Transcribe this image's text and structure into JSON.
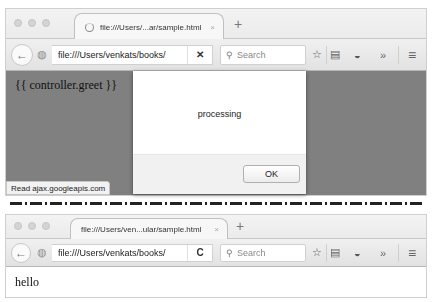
{
  "top_window": {
    "tab": {
      "title": "file:///Users/...ar/sample.html",
      "close": "×",
      "loading": true
    },
    "new_tab": "+",
    "nav": {
      "back": "←",
      "url": "file:///Users/venkats/books/",
      "url_action": "✕",
      "search_placeholder": "Search"
    },
    "toolbar_icons": {
      "bookmark": "☆",
      "reading_list": "▤",
      "pocket": "◒",
      "overflow": "»",
      "menu": "≡"
    },
    "content": {
      "template_text": "{{ controller.greet }}",
      "status_text": "Read ajax.googleapis.com",
      "background": "#808080"
    },
    "dialog": {
      "message": "processing",
      "ok_label": "OK"
    }
  },
  "bottom_window": {
    "tab": {
      "title": "file:///Users/ven...ular/sample.html",
      "close": "×"
    },
    "new_tab": "+",
    "nav": {
      "back": "←",
      "url": "file:///Users/venkats/books/",
      "url_action": "C",
      "search_placeholder": "Search"
    },
    "toolbar_icons": {
      "bookmark": "☆",
      "reading_list": "▤",
      "pocket": "◒",
      "overflow": "»",
      "menu": "≡"
    },
    "content": {
      "text": "hello"
    }
  }
}
